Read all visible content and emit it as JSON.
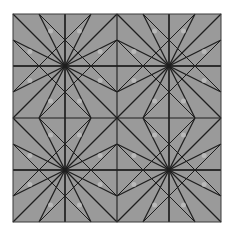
{
  "figure": {
    "background_color": "#ffffff",
    "fill_color": "#9a9a9a",
    "line_color": "#1e1e1e",
    "highlight_color": "#c8c8c8",
    "square": {
      "x": 13,
      "y": 14,
      "size": 208
    },
    "grid_step": 52,
    "major_star_centers": [
      [
        65,
        66
      ],
      [
        169,
        66
      ],
      [
        65,
        170
      ],
      [
        169,
        170
      ]
    ],
    "minor_star_centers": [
      [
        117,
        118
      ],
      [
        117,
        14
      ],
      [
        117,
        222
      ],
      [
        13,
        118
      ],
      [
        221,
        118
      ],
      [
        13,
        14
      ],
      [
        221,
        14
      ],
      [
        13,
        222
      ],
      [
        221,
        222
      ]
    ]
  }
}
